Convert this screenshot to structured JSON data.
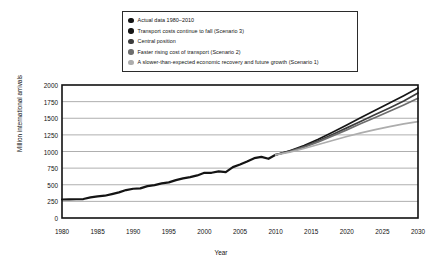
{
  "chart_data": {
    "type": "line",
    "title": "",
    "xlabel": "Year",
    "ylabel": "Million international arrivals",
    "xlim": [
      1980,
      2030
    ],
    "ylim": [
      0,
      2000
    ],
    "xticks": [
      1980,
      1985,
      1990,
      1995,
      2000,
      2005,
      2010,
      2015,
      2020,
      2025,
      2030
    ],
    "yticks": [
      0,
      250,
      500,
      750,
      1000,
      1250,
      1500,
      1750,
      2000
    ],
    "grid": "horizontal",
    "legend_position": "top-center",
    "series": [
      {
        "name": "Actual data 1980–2010",
        "color": "#141414",
        "width": 2.2,
        "x": [
          1980,
          1981,
          1982,
          1983,
          1984,
          1985,
          1986,
          1987,
          1988,
          1989,
          1990,
          1991,
          1992,
          1993,
          1994,
          1995,
          1996,
          1997,
          1998,
          1999,
          2000,
          2001,
          2002,
          2003,
          2004,
          2005,
          2006,
          2007,
          2008,
          2009,
          2010
        ],
        "values": [
          278,
          280,
          282,
          285,
          310,
          325,
          335,
          360,
          385,
          420,
          440,
          445,
          480,
          495,
          520,
          535,
          570,
          595,
          615,
          640,
          680,
          680,
          700,
          690,
          765,
          805,
          850,
          900,
          920,
          890,
          950
        ]
      },
      {
        "name": "Transport costs continue to fall (Scenario 3)",
        "color": "#161616",
        "width": 1.7,
        "x": [
          2010,
          2012,
          2014,
          2016,
          2018,
          2020,
          2022,
          2024,
          2026,
          2028,
          2030
        ],
        "values": [
          950,
          1010,
          1090,
          1185,
          1290,
          1400,
          1510,
          1620,
          1730,
          1840,
          1955
        ]
      },
      {
        "name": "Central position",
        "color": "#3d3d3d",
        "width": 1.7,
        "x": [
          2010,
          2012,
          2014,
          2016,
          2018,
          2020,
          2022,
          2024,
          2026,
          2028,
          2030
        ],
        "values": [
          950,
          1005,
          1075,
          1160,
          1255,
          1355,
          1455,
          1555,
          1655,
          1760,
          1880
        ]
      },
      {
        "name": "Faster rising cost of transport (Scenario 2)",
        "color": "#6e6e6e",
        "width": 1.7,
        "x": [
          2010,
          2012,
          2014,
          2016,
          2018,
          2020,
          2022,
          2024,
          2026,
          2028,
          2030
        ],
        "values": [
          950,
          1000,
          1065,
          1145,
          1235,
          1325,
          1420,
          1510,
          1605,
          1700,
          1800
        ]
      },
      {
        "name": "A slower-than-expected economic recovery and future growth (Scenario 1)",
        "color": "#adadad",
        "width": 1.7,
        "x": [
          2010,
          2012,
          2014,
          2016,
          2018,
          2020,
          2022,
          2024,
          2026,
          2028,
          2030
        ],
        "values": [
          950,
          990,
          1045,
          1105,
          1165,
          1225,
          1280,
          1330,
          1375,
          1415,
          1450
        ]
      }
    ]
  },
  "legend": {
    "items": [
      {
        "label": "Actual data 1980–2010",
        "color": "#141414"
      },
      {
        "label": "Transport costs continue to fall (Scenario 3)",
        "color": "#161616"
      },
      {
        "label": "Central position",
        "color": "#3d3d3d"
      },
      {
        "label": "Faster rising cost of transport (Scenario 2)",
        "color": "#6e6e6e"
      },
      {
        "label": "A slower-than-expected economic recovery and future growth (Scenario 1)",
        "color": "#adadad"
      }
    ]
  },
  "axes": {
    "y_title": "Million international arrivals",
    "x_title": "Year",
    "y_tick_labels": [
      "2000",
      "1750",
      "1500",
      "1250",
      "1000",
      "750",
      "500",
      "250",
      "0"
    ],
    "x_tick_labels": [
      "1980",
      "1985",
      "1990",
      "1995",
      "2000",
      "2005",
      "2010",
      "2015",
      "2020",
      "2025",
      "2030"
    ]
  },
  "style": {
    "plot_border_color": "#111111",
    "gridline_color": "#9a9a9a",
    "background": "#ffffff"
  }
}
